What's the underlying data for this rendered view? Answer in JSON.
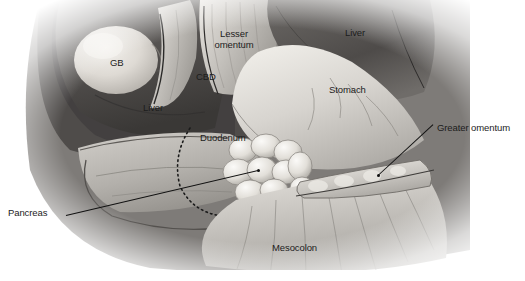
{
  "figure": {
    "kind": "anatomical-illustration",
    "palette": {
      "background": "#ffffff",
      "ink": "#1c1c1c",
      "leader": "#111111",
      "dark_tissue": "#4a4a4a",
      "mid_tissue": "#8d8d8d",
      "light_tissue": "#c9c9c9",
      "highlight": "#eceae6"
    }
  },
  "labels": [
    {
      "id": "gb",
      "text": "GB",
      "x": 110,
      "y": 58,
      "leader": false
    },
    {
      "id": "liver-left",
      "text": "Liver",
      "x": 143,
      "y": 103,
      "leader": false
    },
    {
      "id": "lesser-omentum",
      "text": "Lesser omentum",
      "x": 208,
      "y": 29,
      "leader": false
    },
    {
      "id": "cbd",
      "text": "CBD",
      "x": 196,
      "y": 72,
      "leader": false
    },
    {
      "id": "liver-right",
      "text": "Liver",
      "x": 345,
      "y": 28,
      "leader": false
    },
    {
      "id": "stomach",
      "text": "Stomach",
      "x": 329,
      "y": 85,
      "leader": false
    },
    {
      "id": "duodenum",
      "text": "Duodenum",
      "x": 200,
      "y": 133,
      "leader": false
    },
    {
      "id": "greater-omentum",
      "text": "Greater omentum",
      "x": 437,
      "y": 123,
      "leader": true
    },
    {
      "id": "pancreas",
      "text": "Pancreas",
      "x": 8,
      "y": 208,
      "leader": true
    },
    {
      "id": "mesocolon",
      "text": "Mesocolon",
      "x": 272,
      "y": 243,
      "leader": false
    }
  ],
  "leaders": [
    {
      "id": "pancreas-leader",
      "x1": 66,
      "y1": 215,
      "x2": 258,
      "y2": 170
    },
    {
      "id": "greater-omentum-leader",
      "x1": 433,
      "y1": 124,
      "x2": 378,
      "y2": 175
    }
  ]
}
